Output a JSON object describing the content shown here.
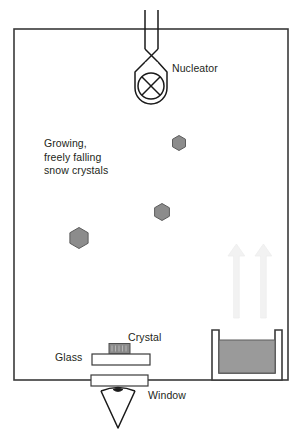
{
  "figure": {
    "type": "apparatus-diagram",
    "canvas": {
      "width": 302,
      "height": 438,
      "background": "#ffffff"
    }
  },
  "colors": {
    "outline": "#3a3a3a",
    "text": "#231f20",
    "crystal_fill": "#8c8c8c",
    "crystal_stroke": "#5d5d5d",
    "water_fill": "#9a9a9a",
    "water_stroke": "#5d5d5d",
    "slide_fill": "#ffffff",
    "arrow_fill": "#f2f2f2",
    "arrow_stroke": "#ededed"
  },
  "labels": {
    "nucleator": "Nucleator",
    "falling_crystals": "Growing,\nfreely falling\nsnow crystals",
    "crystal": "Crystal",
    "glass": "Glass",
    "window": "Window"
  },
  "parts": {
    "chamber": {
      "name": "growth chamber",
      "x": 14,
      "y": 29,
      "width": 274,
      "height": 351
    },
    "nucleator": {
      "name": "nucleator",
      "inlet_tube": {
        "x": 145,
        "y": 10,
        "width": 13,
        "height": 42
      },
      "body": {
        "cx": 151,
        "cy": 75,
        "width": 34,
        "height": 48
      },
      "cross_circle": {
        "cx": 151,
        "cy": 86,
        "r": 13
      }
    },
    "snow_crystals": [
      {
        "id": 1,
        "cx": 179,
        "cy": 143,
        "r": 7.5,
        "note": "smallest, highest"
      },
      {
        "id": 2,
        "cx": 162,
        "cy": 212,
        "r": 8.5,
        "note": "medium"
      },
      {
        "id": 3,
        "cx": 79,
        "cy": 238,
        "r": 10.5,
        "note": "largest, lowest"
      }
    ],
    "vapor_arrows": [
      {
        "id": "left-arrow",
        "x": 236,
        "y_top": 244,
        "y_bottom": 318,
        "direction": "up"
      },
      {
        "id": "right-arrow",
        "x": 263,
        "y_top": 244,
        "y_bottom": 318,
        "direction": "up"
      }
    ],
    "reservoir": {
      "name": "water reservoir",
      "x": 212,
      "y": 330,
      "width": 70,
      "height": 50,
      "water": {
        "x": 219,
        "y": 340,
        "width": 56,
        "height": 34
      }
    },
    "glass_slide": {
      "name": "glass substrate",
      "x": 92,
      "y": 354,
      "width": 58,
      "height": 11
    },
    "deposited_crystal": {
      "name": "deposited crystal",
      "x": 109,
      "y": 343,
      "width": 20,
      "height": 9
    },
    "window": {
      "name": "observation window",
      "x": 91,
      "y": 376,
      "width": 57,
      "height": 11
    },
    "detector": {
      "name": "camera / objective",
      "apex_x": 118,
      "top_y": 390,
      "bottom_y": 428,
      "half_width": 17
    }
  }
}
